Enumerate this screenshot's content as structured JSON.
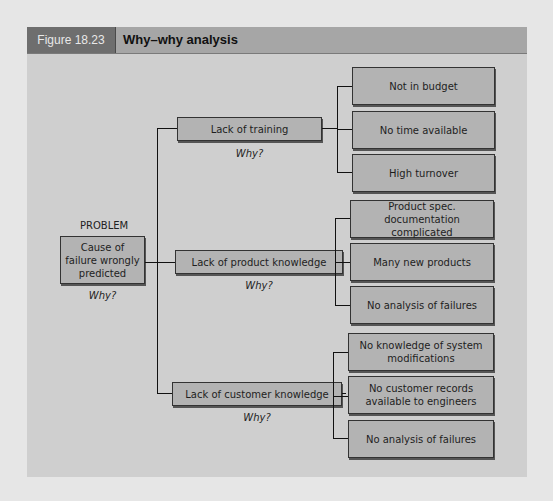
{
  "figure": {
    "number": "Figure 18.23",
    "title": "Why–why analysis"
  },
  "problem": {
    "heading": "PROBLEM",
    "text": "Cause of failure wrongly predicted",
    "why": "Why?"
  },
  "causes": [
    {
      "label": "Lack of training",
      "why": "Why?",
      "reasons": [
        "Not in budget",
        "No time available",
        "High turnover"
      ]
    },
    {
      "label": "Lack of product knowledge",
      "why": "Why?",
      "reasons": [
        "Product spec. documentation complicated",
        "Many new products",
        "No analysis of failures"
      ]
    },
    {
      "label": "Lack of customer knowledge",
      "why": "Why?",
      "reasons": [
        "No knowledge of system modifications",
        "No customer records available to engineers",
        "No analysis of failures"
      ]
    }
  ]
}
